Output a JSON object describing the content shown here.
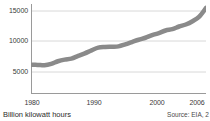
{
  "chart_data": {
    "type": "line",
    "title": "",
    "subtitle": "",
    "xlabel": "",
    "ylabel": "Billion kilowatt hours",
    "axis_caption": "Billion kilowatt hours",
    "source": "Source: EIA, 2",
    "grid": true,
    "grid_orientation": "horizontal",
    "legend": "none",
    "line_color": "#8a8a8a",
    "line_width": 4.5,
    "axis_color": "#9a9a9a",
    "grid_color": "#d8d8d8",
    "text_color": "#3a3a3a",
    "xlim": [
      1980,
      2006
    ],
    "ylim": [
      3000,
      16600
    ],
    "yticks": [
      5000,
      10000,
      15000
    ],
    "ytick_labels": [
      "5000",
      "10000",
      "15000"
    ],
    "xticks": [
      1980,
      1990,
      2000,
      2006
    ],
    "xtick_labels": [
      "1980",
      "1990",
      "2000",
      "2006"
    ],
    "x": [
      1980,
      1981,
      1982,
      1983,
      1984,
      1985,
      1986,
      1987,
      1988,
      1989,
      1990,
      1991,
      1992,
      1993,
      1994,
      1995,
      1996,
      1997,
      1998,
      1999,
      2000,
      2001,
      2002,
      2003,
      2004,
      2005,
      2006
    ],
    "values": [
      7400,
      7400,
      7350,
      7550,
      7950,
      8200,
      8350,
      8750,
      9150,
      9600,
      10000,
      10100,
      10150,
      10200,
      10500,
      10850,
      11200,
      11500,
      11900,
      12200,
      12600,
      12800,
      13200,
      13500,
      14000,
      14700,
      16000
    ],
    "series": [
      {
        "name": "Electricity generation",
        "values": [
          7400,
          7400,
          7350,
          7550,
          7950,
          8200,
          8350,
          8750,
          9150,
          9600,
          10000,
          10100,
          10150,
          10200,
          10500,
          10850,
          11200,
          11500,
          11900,
          12200,
          12600,
          12800,
          13200,
          13500,
          14000,
          14700,
          16000
        ]
      }
    ]
  }
}
